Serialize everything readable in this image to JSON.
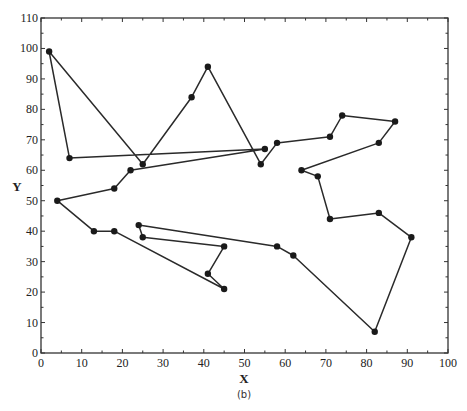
{
  "chart_data": {
    "type": "line",
    "title": "",
    "subtitle_label": "(b)",
    "xlabel": "X",
    "ylabel": "Y",
    "xlim": [
      0,
      100
    ],
    "ylim": [
      0,
      110
    ],
    "xticks": [
      0,
      10,
      20,
      30,
      40,
      50,
      60,
      70,
      80,
      90,
      100
    ],
    "yticks": [
      0,
      10,
      20,
      30,
      40,
      50,
      60,
      70,
      80,
      90,
      100,
      110
    ],
    "grid": false,
    "legend": null,
    "markers": true,
    "closed_path": true,
    "series": [
      {
        "name": "tour",
        "points": [
          [
            2,
            99
          ],
          [
            7,
            64
          ],
          [
            55,
            67
          ],
          [
            22,
            60
          ],
          [
            18,
            54
          ],
          [
            4,
            50
          ],
          [
            13,
            40
          ],
          [
            18,
            40
          ],
          [
            45,
            21
          ],
          [
            41,
            26
          ],
          [
            45,
            35
          ],
          [
            25,
            38
          ],
          [
            24,
            42
          ],
          [
            58,
            35
          ],
          [
            62,
            32
          ],
          [
            82,
            7
          ],
          [
            91,
            38
          ],
          [
            83,
            46
          ],
          [
            71,
            44
          ],
          [
            68,
            58
          ],
          [
            64,
            60
          ],
          [
            83,
            69
          ],
          [
            87,
            76
          ],
          [
            74,
            78
          ],
          [
            71,
            71
          ],
          [
            58,
            69
          ],
          [
            54,
            62
          ],
          [
            41,
            94
          ],
          [
            37,
            84
          ],
          [
            25,
            62
          ],
          [
            2,
            99
          ]
        ]
      }
    ]
  },
  "colors": {
    "line": "#2a2a2a",
    "marker": "#1a1a1a",
    "axis": "#333333"
  }
}
